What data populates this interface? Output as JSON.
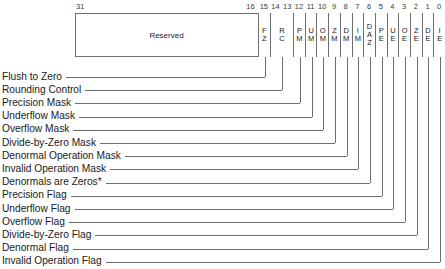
{
  "diagram": {
    "reserved_label": "Reserved",
    "high_bit_label": "31",
    "bit_numbers": [
      "16",
      "15",
      "14",
      "13",
      "12",
      "11",
      "10",
      "9",
      "8",
      "7",
      "6",
      "5",
      "4",
      "3",
      "2",
      "1",
      "0"
    ],
    "fields": [
      {
        "name": "FZ",
        "display": "F\nZ",
        "bits": "15",
        "callout": "Flush to Zero"
      },
      {
        "name": "RC",
        "display": "R\nC",
        "bits": "14-13",
        "callout": "Rounding Control"
      },
      {
        "name": "PM",
        "display": "P\nM",
        "bits": "12",
        "callout": "Precision  Mask"
      },
      {
        "name": "UM",
        "display": "U\nM",
        "bits": "11",
        "callout": "Underflow Mask"
      },
      {
        "name": "OM",
        "display": "O\nM",
        "bits": "10",
        "callout": "Overflow Mask"
      },
      {
        "name": "ZM",
        "display": "Z\nM",
        "bits": "9",
        "callout": "Divide-by-Zero Mask"
      },
      {
        "name": "DM",
        "display": "D\nM",
        "bits": "8",
        "callout": "Denormal Operation Mask"
      },
      {
        "name": "IM",
        "display": "I\nM",
        "bits": "7",
        "callout": "Invalid Operation Mask"
      },
      {
        "name": "DAZ",
        "display": "D\nA\nZ",
        "bits": "6",
        "callout": "Denormals are Zeros*"
      },
      {
        "name": "PE",
        "display": "P\nE",
        "bits": "5",
        "callout": "Precision Flag"
      },
      {
        "name": "UE",
        "display": "U\nE",
        "bits": "4",
        "callout": "Underflow Flag"
      },
      {
        "name": "OE",
        "display": "O\nE",
        "bits": "3",
        "callout": "Overflow Flag"
      },
      {
        "name": "ZE",
        "display": "Z\nE",
        "bits": "2",
        "callout": "Divide-by-Zero Flag"
      },
      {
        "name": "DE",
        "display": "D\nE",
        "bits": "1",
        "callout": "Denormal Flag"
      },
      {
        "name": "IE",
        "display": "I\nE",
        "bits": "0",
        "callout": "Invalid Operation Flag"
      }
    ],
    "colors": {
      "line": "#6e6e6e",
      "text": "#1a1a1a",
      "background": "#ffffff"
    }
  }
}
